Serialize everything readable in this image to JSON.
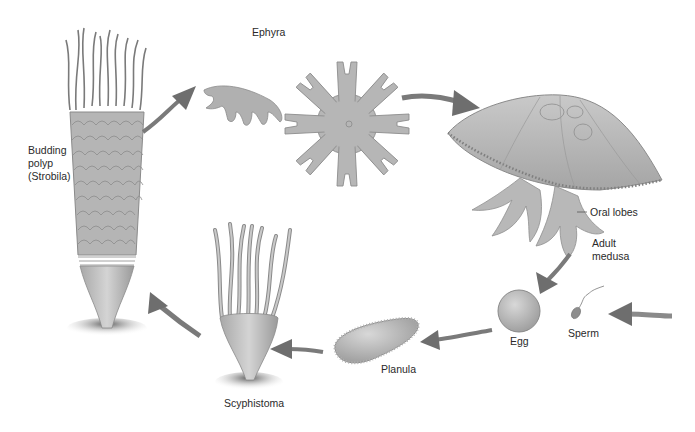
{
  "diagram": {
    "style": "grayscale illustration",
    "colors": {
      "background": "#ffffff",
      "organism_fill": "#b9b9b9",
      "organism_stroke": "#8a8a8a",
      "arrow": "#6e6e6e",
      "label_text": "#2a2a2a"
    },
    "stages": [
      {
        "id": "strobila",
        "label": "Budding\npolyp\n(Strobila)"
      },
      {
        "id": "ephyra",
        "label": "Ephyra"
      },
      {
        "id": "medusa",
        "label": "Adult\nmedusa"
      },
      {
        "id": "oral-lobes",
        "label": "Oral lobes"
      },
      {
        "id": "egg",
        "label": "Egg"
      },
      {
        "id": "sperm",
        "label": "Sperm"
      },
      {
        "id": "planula",
        "label": "Planula"
      },
      {
        "id": "scyphistoma",
        "label": "Scyphistoma"
      }
    ],
    "cycle_order": [
      "strobila",
      "ephyra",
      "medusa",
      "egg",
      "planula",
      "scyphistoma",
      "strobila"
    ]
  }
}
